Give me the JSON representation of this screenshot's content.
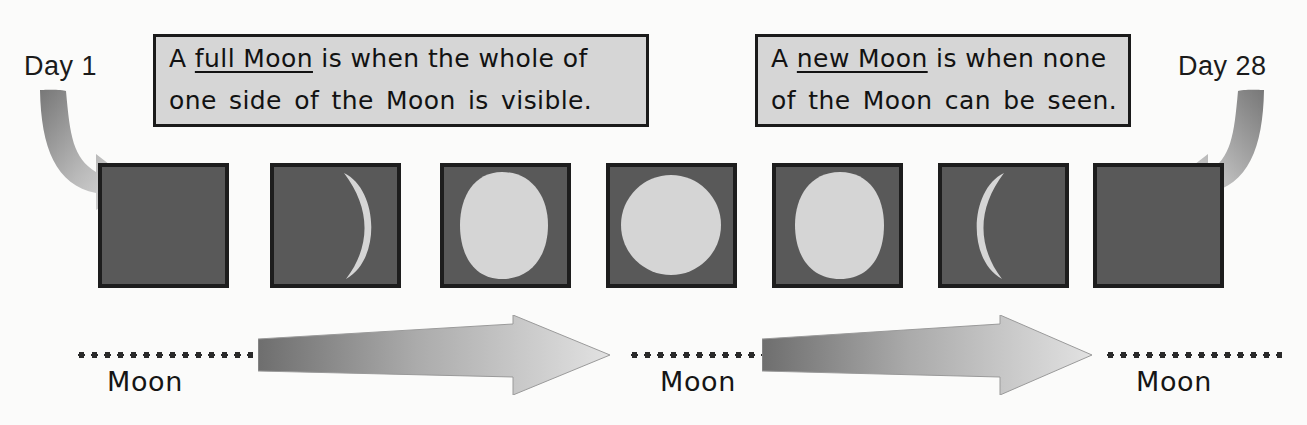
{
  "diagram": {
    "background_color": "#fbfbfa"
  },
  "labels": {
    "day_start": "Day  1",
    "day_end": "Day 28"
  },
  "callouts": [
    {
      "id": "full-moon-callout",
      "line1_prefix": "A ",
      "line1_underlined": "full Moon",
      "line1_suffix": " is when the whole of",
      "line2": "one side of the Moon is visible.",
      "background_color": "#d6d6d6",
      "border_color": "#1a1a1a"
    },
    {
      "id": "new-moon-callout",
      "line1_prefix": "A ",
      "line1_underlined": "new Moon",
      "line1_suffix": " is when none",
      "line2": "of the Moon can be seen.",
      "background_color": "#d6d6d6",
      "border_color": "#1a1a1a"
    }
  ],
  "phase_boxes": [
    {
      "index": 1,
      "phase_name": "new-moon",
      "illumination": "0%",
      "lit_side": "none",
      "day": "1"
    },
    {
      "index": 2,
      "phase_name": "waxing-crescent",
      "illumination": "25%",
      "lit_side": "right",
      "day": ""
    },
    {
      "index": 3,
      "phase_name": "waxing-gibbous",
      "illumination": "85%",
      "lit_side": "right",
      "day": ""
    },
    {
      "index": 4,
      "phase_name": "full-moon",
      "illumination": "100%",
      "lit_side": "all",
      "day": ""
    },
    {
      "index": 5,
      "phase_name": "waning-gibbous",
      "illumination": "85%",
      "lit_side": "left",
      "day": ""
    },
    {
      "index": 6,
      "phase_name": "waning-crescent",
      "illumination": "25%",
      "lit_side": "left",
      "day": ""
    },
    {
      "index": 7,
      "phase_name": "new-moon",
      "illumination": "0%",
      "lit_side": "none",
      "day": "28"
    }
  ],
  "moon_captions": [
    {
      "text": "Moon"
    },
    {
      "text": "Moon"
    },
    {
      "text": "Moon"
    }
  ],
  "colors": {
    "moon_dark": "#595959",
    "moon_lit": "#d5d5d5",
    "box_border": "#1d1d1d",
    "arrow_dark": "#6e6e6e",
    "arrow_light": "#dcdcdc",
    "text": "#151515"
  },
  "arrows": {
    "horizontal_count": 2,
    "curved_count": 2,
    "direction": "left-to-right"
  }
}
